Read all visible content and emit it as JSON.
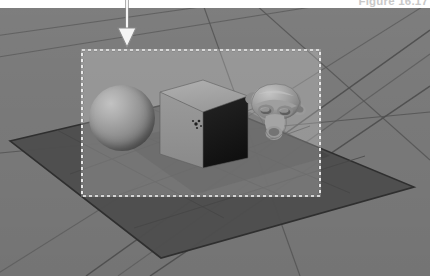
{
  "figure": {
    "caption": "Figure 16.17",
    "caption_color": "#c9c9c9",
    "width": 430,
    "height": 276
  },
  "viewport": {
    "name": "blender-3d-viewport",
    "background_color": "#787878",
    "grid_color": "#5a5a5a",
    "grid_line_count": 6
  },
  "ground_plane": {
    "label": "ground-plane-mesh",
    "fill_color": "#4a4a4a",
    "edge_color": "#2b2b2b",
    "corners": "10,140 196,96 413,186 160,256"
  },
  "render_border": {
    "label": "render-border-region",
    "x": 81,
    "y": 41,
    "width": 240,
    "height": 148,
    "fill_color": "rgba(255,255,255,0.215)",
    "dash_color": "#ffffff",
    "dash_shadow": "#303030",
    "dash_pattern": "3 3"
  },
  "objects": [
    {
      "name": "sphere-object",
      "type": "sphere",
      "label": "Sphere",
      "x": 89,
      "y": 77,
      "width": 66,
      "height": 66,
      "highlight_color": "#c2c2c2",
      "shadow_color": "#3e3e3e"
    },
    {
      "name": "cube-object",
      "type": "cube",
      "label": "Cube",
      "top_face_color": "#a3a3a3",
      "left_face_color": "#8f8f8f",
      "right_face_color": "#1a1a1a",
      "edge_color": "#5e5e5e"
    },
    {
      "name": "monkey-head-object",
      "type": "suzanne",
      "label": "Suzanne",
      "x": 243,
      "y": 66,
      "width": 72,
      "height": 72,
      "body_color": "#9d9d9d",
      "shade_color": "#6a6a6a"
    }
  ],
  "origin_marker": {
    "name": "object-origin-dot",
    "color": "#1c1c1c",
    "x": 193,
    "y": 113
  },
  "annotation": {
    "name": "callout-arrow",
    "description": "white downward arrow pointing to render border top edge",
    "color": "#f4f4f4",
    "stroke_color": "#8a8a8a",
    "tip_x": 127,
    "tip_y": 43,
    "tail_y": 0
  }
}
